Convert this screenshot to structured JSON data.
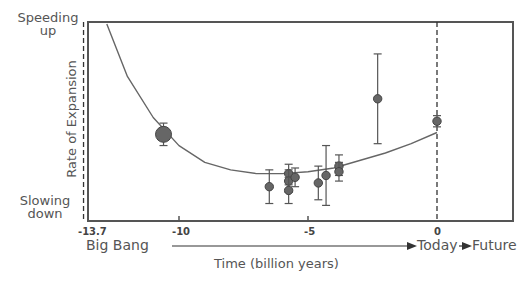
{
  "chart_data": {
    "type": "scatter",
    "title": "",
    "xlabel": "Time (billion years)",
    "ylabel": "Rate of Expansion",
    "y_top_label": "Speeding up",
    "y_bottom_label": "Slowing down",
    "x_axis_annotations": {
      "start": "Big Bang",
      "today": "Today",
      "future": "Future"
    },
    "xlim": [
      -13.9,
      2.9
    ],
    "ylim": [
      0,
      1
    ],
    "x_ticks": [
      -13.7,
      -10,
      -5,
      0
    ],
    "x_tick_labels": [
      "-13.7",
      "-10",
      "-5",
      "0"
    ],
    "vertical_dashed_lines": [
      -13.7,
      0
    ],
    "grid": false,
    "series": [
      {
        "name": "Measurements",
        "points": [
          {
            "x": -10.6,
            "y": 0.41,
            "err_low": 0.06,
            "err_high": 0.06,
            "large": true
          },
          {
            "x": -6.5,
            "y": 0.13,
            "err_low": 0.09,
            "err_high": 0.09
          },
          {
            "x": -5.75,
            "y": 0.2,
            "err_low": 0.06,
            "err_high": 0.05
          },
          {
            "x": -5.75,
            "y": 0.16,
            "err_low": 0.06,
            "err_high": 0.06
          },
          {
            "x": -5.75,
            "y": 0.11,
            "err_low": 0.07,
            "err_high": 0.07
          },
          {
            "x": -5.5,
            "y": 0.18,
            "err_low": 0.05,
            "err_high": 0.05
          },
          {
            "x": -4.6,
            "y": 0.15,
            "err_low": 0.09,
            "err_high": 0.09
          },
          {
            "x": -4.3,
            "y": 0.19,
            "err_low": 0.16,
            "err_high": 0.16
          },
          {
            "x": -3.8,
            "y": 0.24,
            "err_low": 0.05,
            "err_high": 0.06
          },
          {
            "x": -3.8,
            "y": 0.21,
            "err_low": 0.05,
            "err_high": 0.05
          },
          {
            "x": -2.3,
            "y": 0.6,
            "err_low": 0.24,
            "err_high": 0.24
          },
          {
            "x": 0.0,
            "y": 0.48,
            "err_low": 0.03,
            "err_high": 0.03
          }
        ]
      },
      {
        "name": "Model curve",
        "type": "line",
        "x": [
          -12.8,
          -12,
          -11,
          -10,
          -9,
          -8,
          -7,
          -6,
          -5,
          -4,
          -3,
          -2,
          -1,
          0
        ],
        "y": [
          1.0,
          0.72,
          0.5,
          0.35,
          0.26,
          0.22,
          0.2,
          0.2,
          0.21,
          0.23,
          0.27,
          0.31,
          0.36,
          0.42
        ]
      }
    ]
  }
}
